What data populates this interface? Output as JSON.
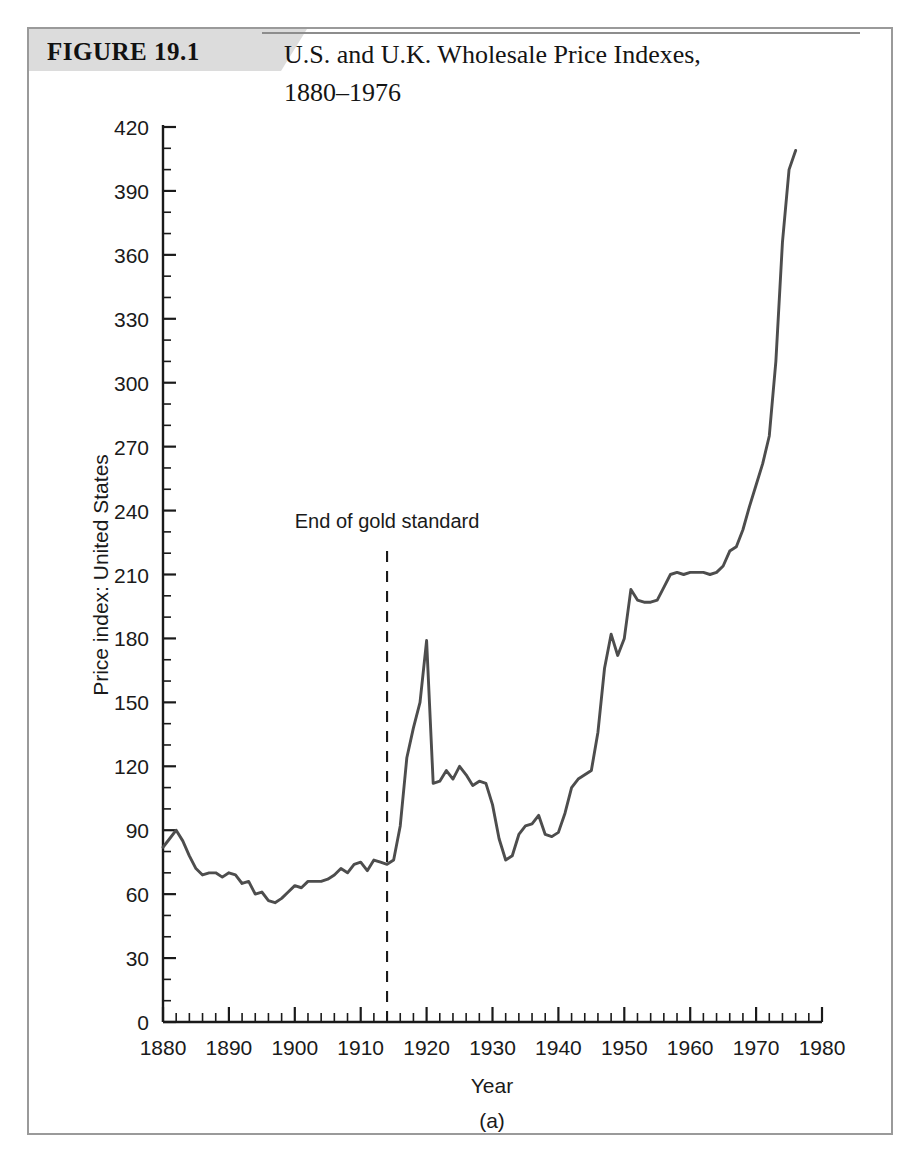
{
  "figure": {
    "number_label": "FIGURE 19.1",
    "title_line1": "U.S. and U.K. Wholesale Price Indexes,",
    "title_line2": "1880–1976",
    "panel_caption": "(a)",
    "banner_color": "#dcdcdc",
    "line_color": "#4d4d4d",
    "frame_color": "#9a9a9a"
  },
  "chart_data": {
    "type": "line",
    "title": "U.S. and U.K. Wholesale Price Indexes, 1880–1976",
    "xlabel": "Year",
    "ylabel": "Price index: United States",
    "xlim": [
      1880,
      1980
    ],
    "ylim": [
      0,
      420
    ],
    "grid": false,
    "legend": null,
    "x_ticks": [
      1880,
      1890,
      1900,
      1910,
      1920,
      1930,
      1940,
      1950,
      1960,
      1970,
      1980
    ],
    "x_tick_labels": [
      "1880",
      "1890",
      "1900",
      "1910",
      "1920",
      "1930",
      "1940",
      "1950",
      "1960",
      "1970",
      "1980"
    ],
    "x_minor_step": 2,
    "y_ticks": [
      0,
      30,
      60,
      90,
      120,
      150,
      180,
      210,
      240,
      270,
      300,
      330,
      360,
      390,
      420
    ],
    "y_tick_labels": [
      "0",
      "30",
      "60",
      "90",
      "120",
      "150",
      "180",
      "210",
      "240",
      "270",
      "300",
      "330",
      "360",
      "390",
      "420"
    ],
    "y_minor_step": 10,
    "annotations": [
      {
        "text": "End of gold standard",
        "x": 1914,
        "label_y": 232,
        "line_from_y": 0,
        "line_to_y": 222,
        "style": "dashed-vertical"
      }
    ],
    "series": [
      {
        "name": "Price index: United States",
        "x": [
          1880,
          1881,
          1882,
          1883,
          1884,
          1885,
          1886,
          1887,
          1888,
          1889,
          1890,
          1891,
          1892,
          1893,
          1894,
          1895,
          1896,
          1897,
          1898,
          1899,
          1900,
          1901,
          1902,
          1903,
          1904,
          1905,
          1906,
          1907,
          1908,
          1909,
          1910,
          1911,
          1912,
          1913,
          1914,
          1915,
          1916,
          1917,
          1918,
          1919,
          1920,
          1921,
          1922,
          1923,
          1924,
          1925,
          1926,
          1927,
          1928,
          1929,
          1930,
          1931,
          1932,
          1933,
          1934,
          1935,
          1936,
          1937,
          1938,
          1939,
          1940,
          1941,
          1942,
          1943,
          1944,
          1945,
          1946,
          1947,
          1948,
          1949,
          1950,
          1951,
          1952,
          1953,
          1954,
          1955,
          1956,
          1957,
          1958,
          1959,
          1960,
          1961,
          1962,
          1963,
          1964,
          1965,
          1966,
          1967,
          1968,
          1969,
          1970,
          1971,
          1972,
          1973,
          1974,
          1975,
          1976
        ],
        "y": [
          82,
          86,
          90,
          85,
          78,
          72,
          69,
          70,
          70,
          68,
          70,
          69,
          65,
          66,
          60,
          61,
          57,
          56,
          58,
          61,
          64,
          63,
          66,
          66,
          66,
          67,
          69,
          72,
          70,
          74,
          75,
          71,
          76,
          75,
          74,
          76,
          92,
          124,
          138,
          150,
          179,
          112,
          113,
          118,
          114,
          120,
          116,
          111,
          113,
          112,
          102,
          86,
          76,
          78,
          88,
          92,
          93,
          97,
          88,
          87,
          89,
          98,
          110,
          114,
          116,
          118,
          136,
          166,
          182,
          172,
          180,
          203,
          198,
          197,
          197,
          198,
          204,
          210,
          211,
          210,
          211,
          211,
          211,
          210,
          211,
          214,
          221,
          223,
          231,
          242,
          252,
          262,
          275,
          310,
          366,
          400,
          409
        ]
      }
    ]
  },
  "plot_geometry": {
    "x_left_px": 163,
    "x_right_px": 822,
    "y_bottom_px": 1022,
    "y_top_px": 127
  }
}
